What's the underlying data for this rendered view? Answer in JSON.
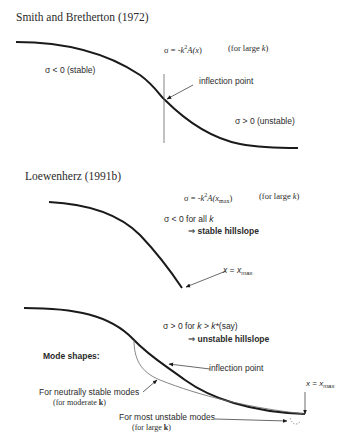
{
  "panel1": {
    "title": "Smith and Bretherton (1972)",
    "equation": "σ = -k²A(x)",
    "equation_parts": {
      "lhs": "σ = -",
      "k": "k",
      "exp": "2",
      "A": "A(",
      "x": "x",
      "close": ")"
    },
    "condition": "(for large k)",
    "condition_parts": {
      "pre": "(for large ",
      "k": "k",
      "post": ")"
    },
    "stable_label": "σ < 0 (stable)",
    "unstable_label": "σ > 0 (unstable)",
    "inflection_label": "inflection point"
  },
  "panel2": {
    "title": "Loewenherz (1991b)",
    "equation": "σ = -k²A(x_max)",
    "equation_parts": {
      "lhs": "σ = -",
      "k": "k",
      "exp": "2",
      "A": "A(",
      "x": "x",
      "sub": "max",
      "close": ")"
    },
    "condition": "(for large k)",
    "condition_parts": {
      "pre": "(for large ",
      "k": "k",
      "post": ")"
    },
    "result_line1": "σ < 0 for all k",
    "result_line1_parts": {
      "pre": "σ < 0 for all ",
      "k": "k"
    },
    "result_line2": "⇒ stable hillslope",
    "result_line2_parts": {
      "arrow": "⇒",
      "text": "stable hillslope"
    },
    "xmax_label": "x = x_max",
    "xmax_parts": {
      "x": "x",
      "eq": " = ",
      "x2": "x",
      "sub": "max"
    }
  },
  "panel3": {
    "result_line1": "σ > 0 for k > k*(say)",
    "result_line1_parts": {
      "pre": "σ > 0 for ",
      "k": "k",
      "mid": " > ",
      "kstar": "k*",
      "post": "(say)"
    },
    "result_line2": "⇒ unstable hillslope",
    "result_line2_parts": {
      "arrow": "⇒",
      "text": "unstable hillslope"
    },
    "mode_shapes_label": "Mode shapes:",
    "inflection_label": "inflection point",
    "neutral_label": "For neutrally stable modes",
    "neutral_sub": "(for moderate k)",
    "neutral_sub_parts": {
      "pre": "(for moderate ",
      "k": "k",
      "post": ")"
    },
    "unstable_label": "For most unstable modes",
    "unstable_sub": "(for large k)",
    "unstable_sub_parts": {
      "pre": "(for large ",
      "k": "k",
      "post": ")"
    },
    "xmax_label": "x = x_max",
    "xmax_parts": {
      "x": "x",
      "eq": " = ",
      "x2": "x",
      "sub": "max"
    }
  },
  "colors": {
    "curve": "#1a1a1a",
    "thin_line": "#555555",
    "text": "#2a2a2a"
  }
}
